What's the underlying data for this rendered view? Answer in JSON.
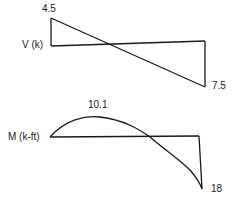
{
  "shear_diagram": {
    "axis_label": "V (k)",
    "max_label": "4.5",
    "min_label": "7.5",
    "max_value": 4.5,
    "min_value": -7.5
  },
  "moment_diagram": {
    "axis_label": "M (k-ft)",
    "max_label": "10.1",
    "min_label": "18",
    "max_value": 10.1,
    "min_value": -18
  },
  "colors": {
    "line": "#1a1a1a",
    "background": "#ffffff"
  }
}
